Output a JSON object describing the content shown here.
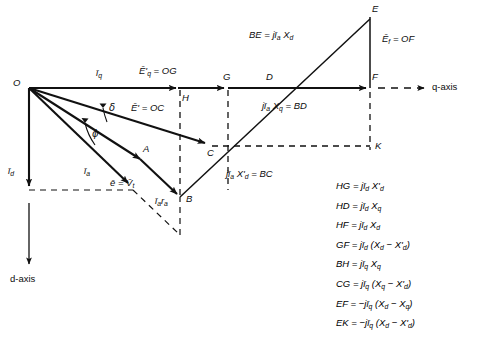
{
  "figure": {
    "kind": "phasor-diagram",
    "title_text": "",
    "background_color": "#ffffff",
    "stroke_color": "#111111"
  },
  "axes": {
    "q_axis_label": "q-axis",
    "d_axis_label": "d-axis"
  },
  "points": {
    "O": "O",
    "A": "A",
    "B": "B",
    "C": "C",
    "D": "D",
    "E": "E",
    "F": "F",
    "G": "G",
    "H": "H",
    "K": "K"
  },
  "angles": {
    "delta": "δ",
    "phi": "ϕ"
  },
  "vectors": {
    "i_q": "ī",
    "i_q_sub": "q",
    "i_d": "ī",
    "i_d_sub": "d",
    "i_a": "ī",
    "i_a_sub": "a"
  },
  "annotations": {
    "Eq_prime": "Ē'",
    "Eq_prime_sub": "q",
    "Eq_prime_eq": " = OG",
    "E_prime": "Ē'",
    "E_prime_eq": " = OC",
    "BE": "BE = jī",
    "BE_sub": "a",
    "BE_tail": " X",
    "BE_tail_sub": "d",
    "Ef": "Ē",
    "Ef_sub": "f",
    "Ef_eq": " = OF",
    "BD": "jī",
    "BD_sub": "a",
    "BD_mid": " X",
    "BD_mid_sub": "q",
    "BD_tail": " = BD",
    "BC": "jī",
    "BC_sub": "a",
    "BC_mid": " X'",
    "BC_mid_sub": "d",
    "BC_tail": " = BC",
    "e_vt": "ē = V̄",
    "e_vt_sub": "t",
    "ia_ra": "ī",
    "ia_ra_sub1": "a",
    "ia_ra_mid": "r",
    "ia_ra_sub2": "a"
  },
  "equations": [
    {
      "id": "eq-hg",
      "lhs": "HG",
      "rhs_pre": " = jī",
      "sub1": "d",
      "rhs_mid": " X'",
      "sub2": "d",
      "rhs_post": ""
    },
    {
      "id": "eq-hd",
      "lhs": "HD",
      "rhs_pre": " = jī",
      "sub1": "d",
      "rhs_mid": " X",
      "sub2": "q",
      "rhs_post": ""
    },
    {
      "id": "eq-hf",
      "lhs": "HF",
      "rhs_pre": " = jī",
      "sub1": "d",
      "rhs_mid": " X",
      "sub2": "d",
      "rhs_post": ""
    },
    {
      "id": "eq-gf",
      "lhs": "GF",
      "rhs_pre": " = jī",
      "sub1": "d",
      "rhs_mid": " (X",
      "sub2": "d",
      "rhs_post": " − X'd)"
    },
    {
      "id": "eq-bh",
      "lhs": "BH",
      "rhs_pre": " = jī",
      "sub1": "q",
      "rhs_mid": " X",
      "sub2": "q",
      "rhs_post": ""
    },
    {
      "id": "eq-cg",
      "lhs": "CG",
      "rhs_pre": " = jī",
      "sub1": "q",
      "rhs_mid": " (X",
      "sub2": "q",
      "rhs_post": " − X'd)"
    },
    {
      "id": "eq-ef",
      "lhs": "EF",
      "rhs_pre": " = −jī",
      "sub1": "q",
      "rhs_mid": " (X",
      "sub2": "d",
      "rhs_post": " − Xq)"
    },
    {
      "id": "eq-ek",
      "lhs": "EK",
      "rhs_pre": " = −jī",
      "sub1": "q",
      "rhs_mid": " (X",
      "sub2": "d",
      "rhs_post": " − X'd)"
    }
  ],
  "equations_text": [
    "HG = jīd X'd",
    "HD = jīd Xq",
    "HF = jīd Xd",
    "GF = jīd (Xd − X'd)",
    "BH = jīq Xq",
    "CG = jīq (Xq − X'd)",
    "EF = −jīq (Xd − Xq)",
    "EK = −jīq (Xd − X'd)"
  ],
  "chart_data": {
    "type": "diagram",
    "origin": {
      "x": 29,
      "y": 88
    },
    "q_axis": {
      "from": [
        29,
        88
      ],
      "to": [
        455,
        88
      ]
    },
    "d_axis": {
      "from": [
        29,
        88
      ],
      "to": [
        29,
        272
      ]
    },
    "nodes": {
      "O": [
        29,
        88
      ],
      "A": [
        140,
        159
      ],
      "B": [
        180,
        197
      ],
      "C": [
        210,
        146
      ],
      "D": [
        271,
        88
      ],
      "E": [
        370,
        17
      ],
      "F": [
        370,
        88
      ],
      "G": [
        228,
        88
      ],
      "H": [
        180,
        88
      ],
      "K": [
        370,
        146
      ]
    }
  }
}
